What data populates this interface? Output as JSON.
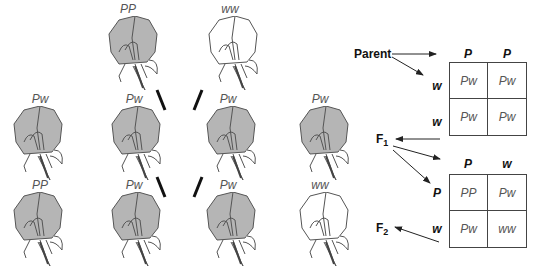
{
  "diagram": {
    "type": "mendelian-cross",
    "colors": {
      "purple_fill": "#b5b5b5",
      "white_fill": "#ffffff",
      "outline": "#555555",
      "text": "#111111",
      "genotype_text": "#555555"
    }
  },
  "parents": [
    {
      "genotype": "PP",
      "color": "purple"
    },
    {
      "genotype": "ww",
      "color": "white"
    }
  ],
  "f1_row": [
    {
      "genotype": "Pw",
      "color": "purple"
    },
    {
      "genotype": "Pw",
      "color": "purple"
    },
    {
      "genotype": "Pw",
      "color": "purple"
    },
    {
      "genotype": "Pw",
      "color": "purple"
    }
  ],
  "f2_row": [
    {
      "genotype": "PP",
      "color": "purple"
    },
    {
      "genotype": "Pw",
      "color": "purple"
    },
    {
      "genotype": "Pw",
      "color": "purple"
    },
    {
      "genotype": "ww",
      "color": "white"
    }
  ],
  "labels": {
    "parent": "Parent",
    "f1": "F",
    "f1_sub": "1",
    "f2": "F",
    "f2_sub": "2"
  },
  "punnett_parent": {
    "col_headers": [
      "P",
      "P"
    ],
    "row_headers": [
      "w",
      "w"
    ],
    "cells": [
      [
        "Pw",
        "Pw"
      ],
      [
        "Pw",
        "Pw"
      ]
    ]
  },
  "punnett_f1": {
    "col_headers": [
      "P",
      "w"
    ],
    "row_headers": [
      "P",
      "w"
    ],
    "cells": [
      [
        "PP",
        "Pw"
      ],
      [
        "Pw",
        "ww"
      ]
    ]
  }
}
